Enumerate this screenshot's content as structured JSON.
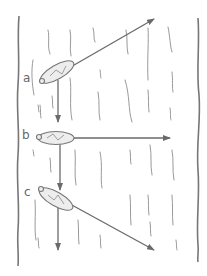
{
  "diagram": {
    "labels": {
      "a": "a",
      "b": "b",
      "c": "c"
    },
    "boats": [
      {
        "id": "a",
        "orientation": "angled upstream",
        "resultant": "up-right diagonal",
        "current": "down"
      },
      {
        "id": "b",
        "orientation": "straight across",
        "resultant": "horizontal right",
        "current": "down"
      },
      {
        "id": "c",
        "orientation": "angled downstream",
        "resultant": "down-right diagonal",
        "current": "down"
      }
    ],
    "colors": {
      "ink": "#6a6a6a",
      "background": "#ffffff"
    }
  }
}
